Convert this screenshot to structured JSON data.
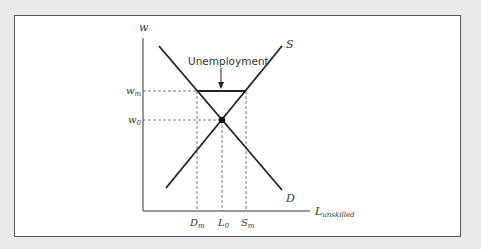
{
  "diagram": {
    "axes": {
      "y_label": "w",
      "x_label_main": "L",
      "x_label_sub": "unskilled"
    },
    "curves": {
      "supply_label": "S",
      "demand_label": "D"
    },
    "y_ticks": {
      "wm_main": "w",
      "wm_sub": "m",
      "w0_main": "w",
      "w0_sub": "0"
    },
    "x_ticks": {
      "dm_main": "D",
      "dm_sub": "m",
      "l0_main": "L",
      "l0_sub": "0",
      "sm_main": "S",
      "sm_sub": "m"
    },
    "annotation": "Unemployment",
    "colors": {
      "line": "#222222",
      "dashed": "#555555",
      "background": "#e9e9e9",
      "panel": "#ffffff"
    }
  }
}
